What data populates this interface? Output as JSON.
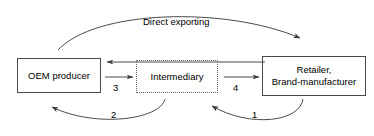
{
  "diagram": {
    "type": "flow-diagram",
    "title": "",
    "background_color": "#ffffff",
    "line_color": "#4a4a4a",
    "text_color": "#000000",
    "nodes": [
      {
        "id": "oem",
        "label": "OEM producer",
        "border_style": "solid",
        "border_color": "#4a4a4a"
      },
      {
        "id": "intermediary",
        "label": "Intermediary",
        "border_style": "dotted",
        "border_color": "#6b6b6b"
      },
      {
        "id": "retailer",
        "label": "Retailer,\nBrand-manufacturer",
        "border_style": "solid",
        "border_color": "#4a4a4a"
      }
    ],
    "edges": [
      {
        "id": "direct-exporting",
        "label": "Direct exporting",
        "from": "oem",
        "to": "retailer",
        "shape": "arc-above",
        "arrowhead": "end"
      },
      {
        "id": "edge-return-top",
        "label": "",
        "from": "retailer",
        "to": "oem",
        "shape": "straight-horizontal",
        "arrowhead": "end"
      },
      {
        "id": "edge-3",
        "label": "3",
        "from": "oem",
        "to": "intermediary",
        "shape": "straight-horizontal",
        "arrowhead": "end"
      },
      {
        "id": "edge-4",
        "label": "4",
        "from": "intermediary",
        "to": "retailer",
        "shape": "straight-horizontal",
        "arrowhead": "end"
      },
      {
        "id": "edge-2",
        "label": "2",
        "from": "intermediary",
        "to": "oem",
        "shape": "arc-below",
        "arrowhead": "end"
      },
      {
        "id": "edge-1",
        "label": "1",
        "from": "retailer",
        "to": "intermediary",
        "shape": "arc-below",
        "arrowhead": "end"
      }
    ]
  }
}
